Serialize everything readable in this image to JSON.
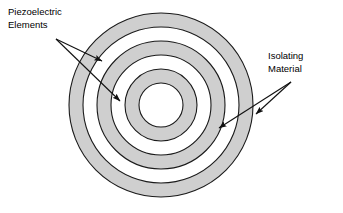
{
  "figure": {
    "type": "concentric-ring-cross-section",
    "title": "",
    "background_color": "#ffffff",
    "stroke_color": "#1a1a1a",
    "ring_fill_gray": "#cfcfcf",
    "ring_fill_white": "#ffffff",
    "center": {
      "x": 161,
      "y": 105
    },
    "rings": [
      {
        "index": 0,
        "outer_radius": 92,
        "inner_radius": 78,
        "fill": "#cfcfcf",
        "material": "Piezoelectric Elements"
      },
      {
        "index": 1,
        "outer_radius": 78,
        "inner_radius": 64,
        "fill": "#ffffff",
        "material": "Isolating Material"
      },
      {
        "index": 2,
        "outer_radius": 64,
        "inner_radius": 50,
        "fill": "#cfcfcf",
        "material": "Piezoelectric Elements"
      },
      {
        "index": 3,
        "outer_radius": 50,
        "inner_radius": 36,
        "fill": "#ffffff",
        "material": "Isolating Material"
      },
      {
        "index": 4,
        "outer_radius": 36,
        "inner_radius": 22,
        "fill": "#cfcfcf",
        "material": "Piezoelectric Elements"
      },
      {
        "index": 5,
        "outer_radius": 22,
        "inner_radius": 0,
        "fill": "#ffffff",
        "material": "Isolating Material"
      }
    ]
  },
  "labels": {
    "piezoelectric": {
      "line1": "Piezoelectric",
      "line2": "Elements",
      "position": "top-left",
      "leader_origin": {
        "x": 56,
        "y": 39
      },
      "arrow_targets": [
        {
          "x": 102,
          "y": 61
        },
        {
          "x": 120,
          "y": 101
        }
      ]
    },
    "isolating": {
      "line1": "Isolating",
      "line2": "Material",
      "position": "right",
      "leader_origin": {
        "x": 291,
        "y": 82
      },
      "arrow_targets": [
        {
          "x": 219,
          "y": 128
        },
        {
          "x": 256,
          "y": 114
        }
      ]
    }
  }
}
